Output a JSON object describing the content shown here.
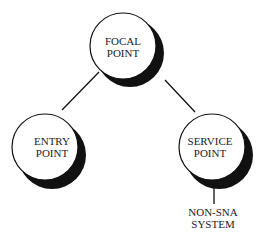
{
  "diagram": {
    "nodes": [
      {
        "id": "focal",
        "lines": [
          "FOCAL",
          "POINT"
        ]
      },
      {
        "id": "entry",
        "lines": [
          "ENTRY",
          "POINT"
        ]
      },
      {
        "id": "service",
        "lines": [
          "SERVICE",
          "POINT"
        ]
      }
    ],
    "external": {
      "lines": [
        "NON-SNA",
        "SYSTEM"
      ]
    },
    "edges": [
      [
        "focal",
        "entry"
      ],
      [
        "focal",
        "service"
      ],
      [
        "service",
        "external"
      ]
    ]
  }
}
